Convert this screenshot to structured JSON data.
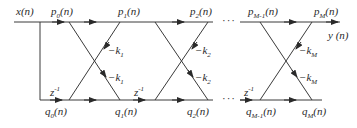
{
  "diagram": {
    "input": {
      "name": "x",
      "arg": "(n)"
    },
    "output": {
      "name": "y",
      "arg": " (n)"
    },
    "top_nodes": [
      {
        "base": "p",
        "sub": "0",
        "arg": "(n)"
      },
      {
        "base": "p",
        "sub": "1",
        "arg": "(n)"
      },
      {
        "base": "p",
        "sub": "2",
        "arg": "(n)"
      },
      {
        "base": "p",
        "sub": "M-1",
        "arg": "(n)"
      },
      {
        "base": "p",
        "sub": "M",
        "arg": "(n)"
      }
    ],
    "bottom_nodes": [
      {
        "base": "q",
        "sub": "0",
        "arg": "(n)"
      },
      {
        "base": "q",
        "sub": "1",
        "arg": "(n)"
      },
      {
        "base": "q",
        "sub": "2",
        "arg": "(n)"
      },
      {
        "base": "q",
        "sub": "M-1",
        "arg": "(n)"
      },
      {
        "base": "q",
        "sub": "M",
        "arg": "(n)"
      }
    ],
    "delays": [
      {
        "base": "z",
        "sup": "-1"
      },
      {
        "base": "z",
        "sup": "-1"
      },
      {
        "base": "z",
        "sup": "-1"
      }
    ],
    "coefficients": [
      {
        "sign": "−",
        "base": "k",
        "sub": "1"
      },
      {
        "sign": "−",
        "base": "k",
        "sub": "1"
      },
      {
        "sign": "−",
        "base": "k",
        "sub": "2"
      },
      {
        "sign": "−",
        "base": "k",
        "sub": "2"
      },
      {
        "sign": "−",
        "base": "k",
        "sub": "M"
      },
      {
        "sign": "−",
        "base": "k",
        "sub": "M"
      }
    ],
    "ellipsis": "···",
    "colors": {
      "line": "#3a3a3a",
      "text": "#2a2a2a"
    }
  }
}
